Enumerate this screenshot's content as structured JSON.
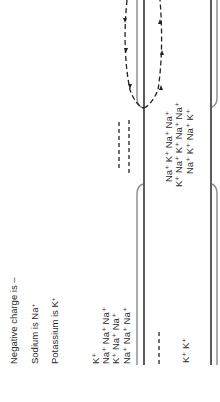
{
  "legend": {
    "negative": "Negative charge is –",
    "sodium": "Sodium is Na",
    "sodium_sup": "+",
    "potassium": "Potassium is K",
    "potassium_sup": "+"
  },
  "outside_left_ions": {
    "rows": [
      "K⁺",
      "Na⁺ Na⁺ Na⁺",
      "K⁺ Na⁺ Na⁺",
      "Na⁺ Na⁺ Na⁺"
    ]
  },
  "inside_bottom_ions": {
    "text": "K⁺ K⁺"
  },
  "inside_middle_ions": {
    "rows": [
      "Na⁺ K⁺ Na⁺ Na⁺",
      "K⁺ Na⁺ K⁺ Na⁺ Na⁺",
      "Na⁺ K⁺ Na⁺ K⁺"
    ]
  },
  "colors": {
    "membrane_dark": "#333333",
    "membrane_light": "#8a8a8a",
    "dashed": "#222222",
    "text": "#2a2a2a"
  }
}
